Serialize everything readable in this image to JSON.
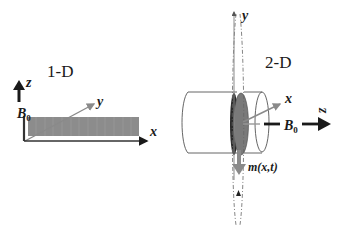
{
  "panels": {
    "one_d": {
      "title": "1-D",
      "axes": {
        "z": "z",
        "y": "y",
        "x": "x"
      },
      "field_label": {
        "base": "B",
        "sub": "0"
      }
    },
    "two_d": {
      "title": "2-D",
      "axes": {
        "y": "y",
        "x": "x",
        "z": "z"
      },
      "field_label": {
        "base": "B",
        "sub": "0"
      },
      "magnetization_label": "m(x,t)"
    }
  },
  "colors": {
    "slab_fill": "#8c8c8c",
    "disk_fill": "#7a7a7a",
    "disk_dark": "#2b2b2b",
    "arrow_gray": "#8a8a8a",
    "arrow_dark": "#1a1a1a",
    "outline": "#555555"
  }
}
